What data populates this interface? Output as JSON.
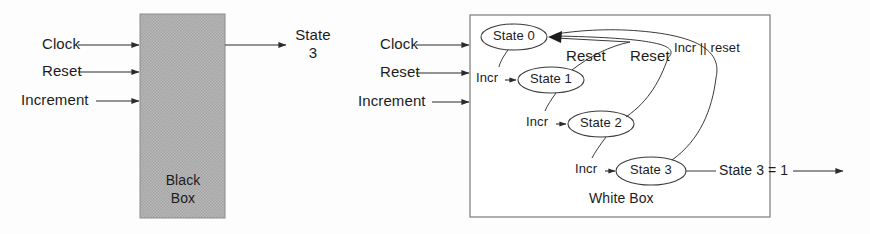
{
  "figure": {
    "kind": "block-and-state-diagram",
    "line_color": "#2b2b2b",
    "black_box_fill": "#b2b2b2",
    "white_box_fill": "#ffffff",
    "text_color": "#1c1c1c"
  },
  "black_box": {
    "caption_line1": "Black",
    "caption_line2": "Box",
    "inputs": [
      {
        "label": "Clock"
      },
      {
        "label": "Reset"
      },
      {
        "label": "Increment"
      }
    ],
    "output": {
      "label_line1": "State",
      "label_line2": "3"
    }
  },
  "white_box": {
    "caption": "White Box",
    "inputs": [
      {
        "label": "Clock"
      },
      {
        "label": "Reset"
      },
      {
        "label": "Increment"
      }
    ],
    "states": [
      {
        "id": "state-0",
        "label": "State 0"
      },
      {
        "id": "state-1",
        "label": "State 1"
      },
      {
        "id": "state-2",
        "label": "State 2"
      },
      {
        "id": "state-3",
        "label": "State 3"
      }
    ],
    "transition_labels": [
      {
        "id": "incr-0-1",
        "label": "Incr"
      },
      {
        "id": "incr-1-2",
        "label": "Incr"
      },
      {
        "id": "incr-2-3",
        "label": "Incr"
      },
      {
        "id": "reset-1-0",
        "label": "Reset"
      },
      {
        "id": "reset-2-0",
        "label": "Reset"
      },
      {
        "id": "incr-or-reset-3-0",
        "label": "Incr || reset"
      }
    ],
    "output": {
      "label": "State 3 = 1"
    }
  }
}
